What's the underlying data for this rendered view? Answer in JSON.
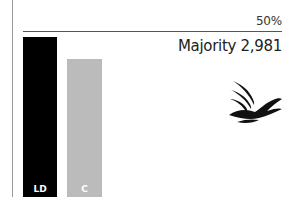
{
  "chart_data": {
    "type": "bar",
    "title": "",
    "categories": [
      "LD",
      "C"
    ],
    "values": [
      48.2,
      41.6
    ],
    "colors": [
      "#000000",
      "#bbbbbb"
    ],
    "xlabel": "",
    "ylabel": "",
    "ylim": [
      0,
      50
    ],
    "reference_line": {
      "value": 50,
      "label": "50%"
    },
    "annotations": [
      "Majority 2,981"
    ],
    "grid": false,
    "legend": "none"
  },
  "labels": {
    "ref_line": "50%",
    "majority": "Majority 2,981",
    "bar_ld": "LD",
    "bar_c": "C"
  },
  "logo": {
    "name": "liberal-democrats-bird-logo"
  }
}
